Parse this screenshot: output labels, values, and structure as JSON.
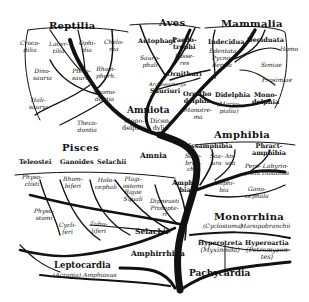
{
  "diagram": {
    "root": "Pachycardia",
    "groups": [
      {
        "name": "Reptilia",
        "members": [
          "Crocodilia",
          "Lacertilia",
          "Ophidia",
          "Chelonia",
          "Dinosauria",
          "Pterosauria",
          "Rhamphorhynchia",
          "Halisauria",
          "Anomodontia",
          "Theriodontia"
        ]
      },
      {
        "name": "Aves",
        "members": [
          "Autophagi",
          "Paedotrophi",
          "Passeres",
          "Saurophali",
          "Ornithuri",
          "Archaeopteryx",
          "Sauriuri"
        ]
      },
      {
        "name": "Mammalia",
        "members": [
          "Indecidua",
          "Edentata",
          "Pycnoderma",
          "Deciduata",
          "Homo",
          "Simiae",
          "Prosimiae",
          "Monodelphia",
          "Didelphia",
          "Marsupialia",
          "Ornithodelphia",
          "Monotremata"
        ]
      },
      {
        "name": "Amphibia",
        "members": [
          "Lissamphibia",
          "Sozobranchia",
          "Sozura",
          "Anura",
          "Phractamphibia",
          "Peromela",
          "Labyrinthodonta",
          "Amphibia",
          "Ganocephala"
        ]
      },
      {
        "name": "Pisces",
        "members": [
          "Teleostei",
          "Ganoides",
          "Selachii",
          "Physoclisti",
          "Physostomi",
          "Rhombiferi",
          "Cycliferi",
          "Tubuliferi",
          "Holocephali",
          "Plagiostomi",
          "Rajae",
          "Squali",
          "Dipneusti",
          "Protopteri"
        ]
      },
      {
        "name": "Monorrhina",
        "members": [
          "Cyclostoma",
          "Marsipobranchii",
          "Hyperotreta",
          "Myxinoida",
          "Hyperoartia",
          "Petromyzontes"
        ]
      }
    ],
    "nodes": {
      "amniota": "Amniota",
      "mono": "Mono-",
      "mono2": "delphia",
      "dicen": "Dicen-",
      "dicen2": "dylia",
      "amnia": "Amnia",
      "amphibia_stem": "Amphi-",
      "amphibia_stem2": "bia",
      "selachii": "Selachii",
      "amphirrhina": "Amphirrhina",
      "pachycardia": "Pachycardia",
      "leptocardia": "Leptocardia",
      "leptocardia_sub": "(Acrania) Amphioxus"
    },
    "labels": {
      "crocodilia": [
        "Croco-",
        "dilia"
      ],
      "lacertilia": [
        "Lacer-",
        "tilia"
      ],
      "ophidia": [
        "Ophi-",
        "dia"
      ],
      "chelonia": [
        "Chelo-",
        "nia"
      ],
      "dinosauria": [
        "Dino-",
        "sauria"
      ],
      "pterosauria": [
        "Ptero-",
        "sauria"
      ],
      "rhamphorhynchia": [
        "Rham-",
        "phorh."
      ],
      "halisauria": [
        "Hali-",
        "sauria"
      ],
      "anomodontia": [
        "Anomo-",
        "dontia"
      ],
      "theriodontia": [
        "Theco-",
        "dontia"
      ],
      "autophagi": "Autophagi",
      "paedotrophi": [
        "Paedo-",
        "trophi"
      ],
      "passeres": [
        "Passe-",
        "res"
      ],
      "saurophali": [
        "Sauro-",
        "phali"
      ],
      "ornithuri": "Ornithuri",
      "archaeopteryx": "Archaeopteryx",
      "sauriuri": "Sauriuri",
      "indecidua": "Indecidua",
      "edentata": "Edentata",
      "pycnoderma": [
        "Pycno-",
        "derma"
      ],
      "deciduata": "Deciduata",
      "homo": "Homo",
      "simiae": "Simiae",
      "prosimiae": "Prosimiae",
      "ornithodelphia": [
        "Ornitho",
        "delphia"
      ],
      "monotrema": [
        "Monotre-",
        "ma"
      ],
      "didelphia": "Didelphia",
      "marsupialia": [
        "(Marsu-",
        "pialia)"
      ],
      "monodelphia_m": [
        "Mono-",
        "delphia"
      ],
      "lissamphibia": "Lissamphibia",
      "sozobranchia": [
        "Sozo-",
        "bran-",
        "chia"
      ],
      "sozura": [
        "Soz-",
        "ura"
      ],
      "anura": [
        "An-",
        "ura"
      ],
      "phractamphibia": [
        "Phract-",
        "amphibia"
      ],
      "peromela": [
        "Pero-",
        "mela"
      ],
      "labyrinthodonta": [
        "Labyrin-",
        "thodonta"
      ],
      "amphibia_sub": [
        "Amphi-",
        "bia"
      ],
      "ganocephala": [
        "Gano-",
        "cephala"
      ],
      "teleostei": "Teleostei",
      "ganoides": "Ganoides",
      "selachii_h": "Selachii",
      "physoclisti": [
        "Physo-",
        "clisti"
      ],
      "physostomi": [
        "Physo-",
        "stomi"
      ],
      "rhombiferi": [
        "Rhom-",
        "biferi"
      ],
      "cycliferi": [
        "Cycli-",
        "feri"
      ],
      "tubuliferi": [
        "Tubu-",
        "liferi"
      ],
      "holocephali": [
        "Holo-",
        "cephali"
      ],
      "plagiostomi": [
        "Plagi-",
        "ostomi",
        "Rajae",
        "Squali"
      ],
      "dipneusti": [
        "Dipneusti",
        "Protopte-",
        "ri"
      ],
      "cyclostoma": "(Cyclostoma)",
      "marsipobranchii": "Marsipobranchii",
      "hyperotreta": [
        "Hyperotreta",
        "(Myxinoida)"
      ],
      "hyperoartia": [
        "Hyperoartia",
        "(Petromyzon",
        "tes)"
      ]
    },
    "colors": {
      "ink": "#111111",
      "paper": "#ffffff"
    }
  }
}
